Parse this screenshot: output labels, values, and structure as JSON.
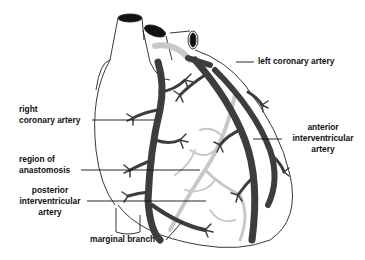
{
  "diagram": {
    "colors": {
      "artery_dark": "#3d3d3d",
      "artery_light": "#c8c8c8",
      "outline": "#222222",
      "leader": "#111111",
      "text": "#111111"
    },
    "labels": {
      "left_coronary": "left coronary artery",
      "right_coronary_1": "right",
      "right_coronary_2": "coronary artery",
      "anterior_1": "anterior",
      "anterior_2": "interventricular",
      "anterior_3": "artery",
      "anastomosis_1": "region of",
      "anastomosis_2": "anastomosis",
      "posterior_1": "posterior",
      "posterior_2": "interventricular",
      "posterior_3": "artery",
      "marginal": "marginal branch"
    }
  }
}
